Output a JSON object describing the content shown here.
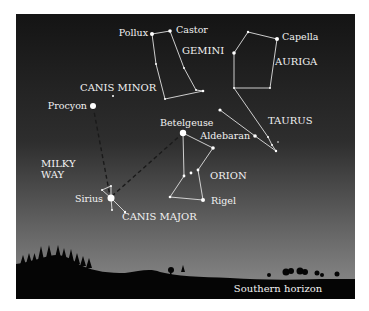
{
  "colors": {
    "sky_top": "#141414",
    "sky_mid": "#3a3a3a",
    "sky_bottom": "#8a8a8a",
    "ground": "#050505",
    "line": "#e8e8e8",
    "star": "#ffffff",
    "label": "#f2f2f2"
  },
  "constellations": [
    {
      "name": "GEMINI",
      "label_pos": [
        182,
        52
      ]
    },
    {
      "name": "AURIGA",
      "label_pos": [
        275,
        63
      ]
    },
    {
      "name": "TAURUS",
      "label_pos": [
        268,
        124
      ]
    },
    {
      "name": "CANIS MINOR",
      "label_pos": [
        80,
        90
      ]
    },
    {
      "name": "ORION",
      "label_pos": [
        210,
        179
      ]
    },
    {
      "name": "CANIS MAJOR",
      "label_pos": [
        122,
        219
      ]
    }
  ],
  "stars": [
    {
      "name": "Pollux",
      "pos": [
        152,
        34
      ],
      "label_pos": [
        148,
        36
      ],
      "anchor": "end"
    },
    {
      "name": "Castor",
      "pos": [
        170,
        31
      ],
      "label_pos": [
        176,
        33
      ],
      "anchor": "start"
    },
    {
      "name": "Capella",
      "pos": [
        276,
        39
      ],
      "label_pos": [
        282,
        40
      ],
      "anchor": "start"
    },
    {
      "name": "Procyon",
      "pos": [
        93,
        106
      ],
      "label_pos": [
        87,
        108
      ],
      "anchor": "end"
    },
    {
      "name": "Betelgeuse",
      "pos": [
        183,
        133
      ],
      "label_pos": [
        160,
        125
      ],
      "anchor": "start"
    },
    {
      "name": "Aldebaran",
      "pos": [
        255,
        136
      ],
      "label_pos": [
        250,
        138
      ],
      "anchor": "end"
    },
    {
      "name": "Sirius",
      "pos": [
        111,
        198
      ],
      "label_pos": [
        103,
        201
      ],
      "anchor": "end"
    },
    {
      "name": "Rigel",
      "pos": [
        203,
        200
      ],
      "label_pos": [
        211,
        203
      ],
      "anchor": "start"
    }
  ],
  "annotations": {
    "milky_way": [
      "MILKY",
      "WAY"
    ],
    "horizon": "Southern horizon"
  }
}
